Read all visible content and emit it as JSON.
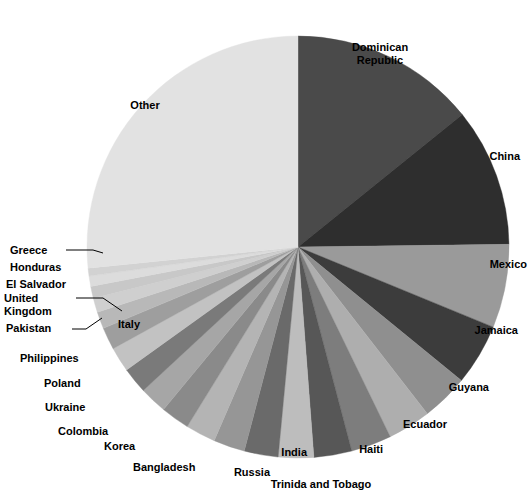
{
  "chart_data": {
    "type": "pie",
    "title": "",
    "subtitle": "",
    "xlabel": "",
    "ylabel": "",
    "legend_position": "none",
    "grid": false,
    "start_angle_deg": 0,
    "direction": "clockwise",
    "categories": [
      "Dominican Republic",
      "China",
      "Mexico",
      "Jamaica",
      "Guyana",
      "Ecuador",
      "Haiti",
      "Trinida and Tobago",
      "India",
      "Russia",
      "Bangladesh",
      "Korea",
      "Colombia",
      "Ukraine",
      "Poland",
      "Philippines",
      "Italy",
      "Pakistan",
      "United Kingdom",
      "El Salvador",
      "Honduras",
      "Greece",
      "Other"
    ],
    "values": [
      14.2,
      10.6,
      6.4,
      4.7,
      3.6,
      3.3,
      3.1,
      2.9,
      2.7,
      2.6,
      2.4,
      2.3,
      2.2,
      2.1,
      2.0,
      1.9,
      1.7,
      1.3,
      1.1,
      0.9,
      0.8,
      0.6,
      26.6
    ],
    "unit": "percent",
    "colors": [
      "#4a4a4a",
      "#2e2e2e",
      "#9a9a9a",
      "#3c3c3c",
      "#8f8f8f",
      "#aeaeae",
      "#7d7d7d",
      "#575757",
      "#bdbdbd",
      "#6a6a6a",
      "#969696",
      "#b4b4b4",
      "#8a8a8a",
      "#a6a6a6",
      "#7a7a7a",
      "#c2c2c2",
      "#9e9e9e",
      "#b8b8b8",
      "#cfcfcf",
      "#c8c8c8",
      "#dcdcdc",
      "#d2d2d2",
      "#e2e2e2"
    ]
  },
  "labels": {
    "dominican_republic": "Dominican\nRepublic",
    "china": "China",
    "mexico": "Mexico",
    "jamaica": "Jamaica",
    "guyana": "Guyana",
    "ecuador": "Ecuador",
    "haiti": "Haiti",
    "trinidad_tobago": "Trinida and Tobago",
    "india": "India",
    "russia": "Russia",
    "bangladesh": "Bangladesh",
    "korea": "Korea",
    "colombia": "Colombia",
    "ukraine": "Ukraine",
    "poland": "Poland",
    "philippines": "Philippines",
    "italy": "Italy",
    "pakistan": "Pakistan",
    "united_kingdom": "United\nKingdom",
    "el_salvador": "El Salvador",
    "honduras": "Honduras",
    "greece": "Greece",
    "other": "Other"
  },
  "geometry": {
    "center_x": 298,
    "center_y": 247,
    "radius": 211
  }
}
